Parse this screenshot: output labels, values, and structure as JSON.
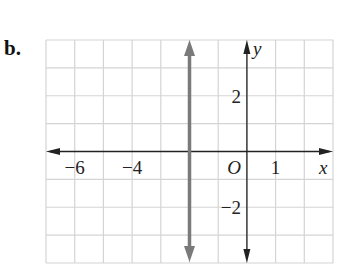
{
  "problem_label": "b.",
  "chart_data": {
    "type": "line",
    "title": "",
    "xlabel": "x",
    "ylabel": "y",
    "origin_label": "O",
    "xlim": [
      -7,
      3
    ],
    "ylim": [
      -4,
      4
    ],
    "grid": true,
    "x_tick_labels": [
      {
        "value": -6,
        "text": "−6"
      },
      {
        "value": -4,
        "text": "−4"
      },
      {
        "value": 1,
        "text": "1"
      }
    ],
    "y_tick_labels": [
      {
        "value": 2,
        "text": "2"
      },
      {
        "value": -2,
        "text": "−2"
      }
    ],
    "series": [
      {
        "name": "x = -2",
        "kind": "vertical_line",
        "x": -2,
        "color": "#7a7a7a",
        "arrows": "both"
      }
    ]
  },
  "colors": {
    "grid": "#d4d4d4",
    "axes": "#222222",
    "graph_line": "#7a7a7a"
  }
}
